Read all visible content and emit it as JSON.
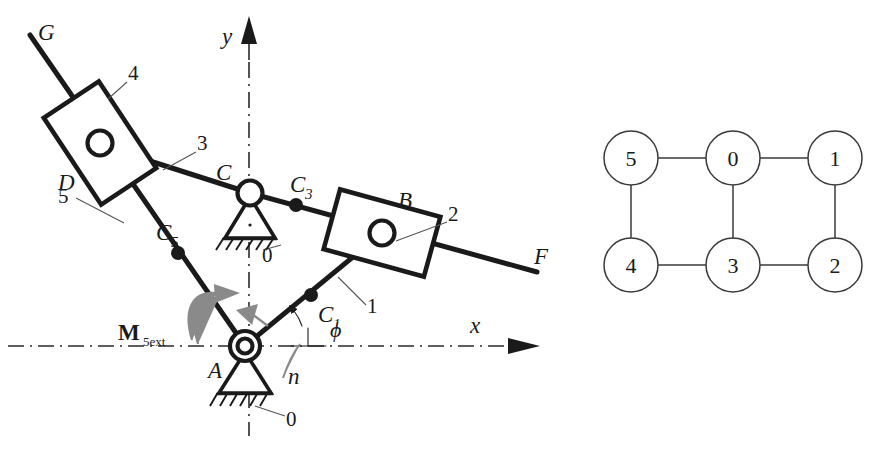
{
  "figure": {
    "background_color": "#ffffff",
    "line_color": "#1a1a1a",
    "accent_gray": "#8a8a8a"
  },
  "mechanism": {
    "axes": {
      "x_label": "x",
      "y_label": "y",
      "style": "dash-dot center line with solid arrowhead"
    },
    "joints": [
      {
        "id": "A",
        "label": "A",
        "type": "fixed-pivot-ground",
        "x": 245,
        "y": 346
      },
      {
        "id": "C",
        "label": "C",
        "type": "fixed-pivot-ground",
        "x": 250,
        "y": 193
      },
      {
        "id": "B",
        "label": "B",
        "type": "slider-block-pin",
        "x": 382,
        "y": 233
      },
      {
        "id": "D",
        "label": "D",
        "type": "slider-block-pin",
        "x": 100,
        "y": 143
      }
    ],
    "contact_points": [
      {
        "id": "C1",
        "label": "C",
        "sub": "1",
        "x": 311,
        "y": 295
      },
      {
        "id": "C3",
        "label": "C",
        "sub": "3",
        "x": 296,
        "y": 205
      },
      {
        "id": "C5",
        "label": "C",
        "sub": "5",
        "x": 178,
        "y": 253
      }
    ],
    "line_endpoints": [
      {
        "id": "G",
        "label": "G",
        "x": 28,
        "y": 30
      },
      {
        "id": "F",
        "label": "F",
        "x": 540,
        "y": 258
      }
    ],
    "link_labels": [
      {
        "id": "link1",
        "label": "1",
        "x": 371,
        "y": 310
      },
      {
        "id": "link2",
        "label": "2",
        "x": 452,
        "y": 218
      },
      {
        "id": "link3",
        "label": "3",
        "x": 201,
        "y": 145
      },
      {
        "id": "link4",
        "label": "4",
        "x": 133,
        "y": 75
      },
      {
        "id": "link5",
        "label": "5",
        "x": 62,
        "y": 196
      }
    ],
    "ground_labels": [
      {
        "id": "ground-C",
        "label": "0",
        "x": 268,
        "y": 253
      },
      {
        "id": "ground-A",
        "label": "0",
        "x": 290,
        "y": 423
      }
    ],
    "moment": {
      "label_main": "M",
      "label_sub": "5ext",
      "x": 130,
      "y": 333,
      "description": "external moment applied to link 5, curved double arrow"
    },
    "angle": {
      "label": "ϕ",
      "x": 319,
      "y": 330,
      "normal_label": "n",
      "normal_x": 290,
      "normal_y": 375,
      "description": "input crank angle measured from x axis"
    }
  },
  "graph": {
    "caption": "contracted graph of the mechanism",
    "nodes": [
      {
        "id": "n5",
        "label": "5",
        "x": 631,
        "y": 158
      },
      {
        "id": "n0",
        "label": "0",
        "x": 733,
        "y": 158
      },
      {
        "id": "n1",
        "label": "1",
        "x": 835,
        "y": 158
      },
      {
        "id": "n4",
        "label": "4",
        "x": 631,
        "y": 265
      },
      {
        "id": "n3",
        "label": "3",
        "x": 733,
        "y": 265
      },
      {
        "id": "n2",
        "label": "2",
        "x": 835,
        "y": 265
      }
    ],
    "radius": 27,
    "edges": [
      {
        "from": "n5",
        "to": "n0"
      },
      {
        "from": "n0",
        "to": "n1"
      },
      {
        "from": "n5",
        "to": "n4"
      },
      {
        "from": "n0",
        "to": "n3"
      },
      {
        "from": "n1",
        "to": "n2"
      },
      {
        "from": "n4",
        "to": "n3"
      },
      {
        "from": "n3",
        "to": "n2"
      }
    ]
  }
}
